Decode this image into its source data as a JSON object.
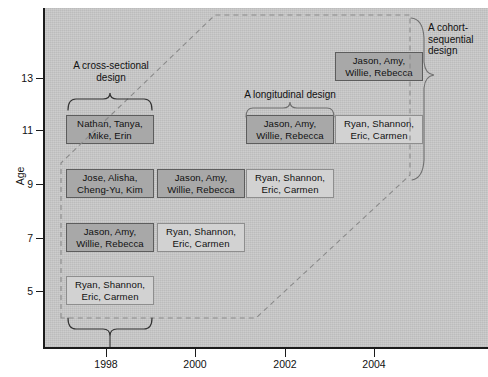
{
  "chart_data": {
    "type": "diagram",
    "title": "",
    "xlabel": "",
    "ylabel": "Age",
    "x_ticks": [
      "1998",
      "2000",
      "2002",
      "2004"
    ],
    "y_ticks": [
      "5",
      "7",
      "9",
      "11",
      "13"
    ],
    "xlim": [
      1996.6,
      2006.0
    ],
    "ylim": [
      3.6,
      14.6
    ],
    "grid": false,
    "legend": "none",
    "background_color": "#c9c9c9",
    "shaded_box_color": "#a8a8a8",
    "light_box_color": "#d2d2d2",
    "cohorts": [
      {
        "id": "cohort-1",
        "names_line1": "Ryan, Shannon,",
        "names_line2": "Eric, Carmen"
      },
      {
        "id": "cohort-2",
        "names_line1": "Jason, Amy,",
        "names_line2": "Willie, Rebecca"
      },
      {
        "id": "cohort-3",
        "names_line1": "Jose, Alisha,",
        "names_line2": "Cheng-Yu, Kim"
      },
      {
        "id": "cohort-4",
        "names_line1": "Nathan, Tanya,",
        "names_line2": "Mike, Erin"
      }
    ],
    "cells": [
      {
        "year": "1998",
        "age": "5",
        "line1": "Ryan, Shannon,",
        "line2": "Eric, Carmen",
        "shaded": false
      },
      {
        "year": "1998",
        "age": "7",
        "line1": "Jason, Amy,",
        "line2": "Willie, Rebecca",
        "shaded": true
      },
      {
        "year": "1998",
        "age": "9",
        "line1": "Jose, Alisha,",
        "line2": "Cheng-Yu, Kim",
        "shaded": true
      },
      {
        "year": "1998",
        "age": "11",
        "line1": "Nathan, Tanya,",
        "line2": "Mike, Erin",
        "shaded": true
      },
      {
        "year": "2000",
        "age": "7",
        "line1": "Ryan, Shannon,",
        "line2": "Eric, Carmen",
        "shaded": false
      },
      {
        "year": "2000",
        "age": "9",
        "line1": "Jason, Amy,",
        "line2": "Willie, Rebecca",
        "shaded": true
      },
      {
        "year": "2002",
        "age": "9",
        "line1": "Ryan, Shannon,",
        "line2": "Eric, Carmen",
        "shaded": false
      },
      {
        "year": "2002",
        "age": "11",
        "line1": "Jason, Amy,",
        "line2": "Willie, Rebecca",
        "shaded": true
      },
      {
        "year": "2004",
        "age": "11",
        "line1": "Ryan, Shannon,",
        "line2": "Eric, Carmen",
        "shaded": false
      },
      {
        "year": "2004",
        "age": "13",
        "line1": "Jason, Amy,",
        "line2": "Willie, Rebecca",
        "shaded": true
      }
    ],
    "annotations": [
      {
        "id": "cross-sectional",
        "line1": "A cross-sectional",
        "line2": "design",
        "brace": "horizontal-up"
      },
      {
        "id": "longitudinal",
        "line1": "A longitudinal design",
        "line2": "",
        "brace": "horizontal-down"
      },
      {
        "id": "cohort-sequential",
        "line1": "A cohort-",
        "line2": "sequential",
        "line3": "design",
        "brace": "vertical-right"
      },
      {
        "id": "cohort-brace-bottom",
        "line1": "",
        "line2": "",
        "brace": "horizontal-down"
      }
    ]
  },
  "axis": {
    "y_title": "Age",
    "y_ticks": [
      {
        "label": "13",
        "top": 78
      },
      {
        "label": "11",
        "top": 130
      },
      {
        "label": "9",
        "top": 184
      },
      {
        "label": "7",
        "top": 238
      },
      {
        "label": "5",
        "top": 291
      }
    ],
    "x_ticks": [
      {
        "label": "1998",
        "left": 106
      },
      {
        "label": "2000",
        "left": 195
      },
      {
        "label": "2002",
        "left": 285
      },
      {
        "label": "2004",
        "left": 374
      }
    ]
  },
  "boxes": [
    {
      "name": "box-1998-age11",
      "line1": "Nathan, Tanya,",
      "line2": "Mike, Erin",
      "shaded": true,
      "left": 66,
      "top": 115,
      "width": 88,
      "height": 29
    },
    {
      "name": "box-1998-age9",
      "line1": "Jose, Alisha,",
      "line2": "Cheng-Yu, Kim",
      "shaded": true,
      "left": 66,
      "top": 169,
      "width": 88,
      "height": 29
    },
    {
      "name": "box-1998-age7",
      "line1": "Jason, Amy,",
      "line2": "Willie, Rebecca",
      "shaded": true,
      "left": 66,
      "top": 223,
      "width": 88,
      "height": 29
    },
    {
      "name": "box-1998-age5",
      "line1": "Ryan, Shannon,",
      "line2": "Eric, Carmen",
      "shaded": false,
      "left": 66,
      "top": 276,
      "width": 88,
      "height": 29
    },
    {
      "name": "box-2000-age9",
      "line1": "Jason, Amy,",
      "line2": "Willie, Rebecca",
      "shaded": true,
      "left": 157,
      "top": 169,
      "width": 88,
      "height": 29
    },
    {
      "name": "box-2000-age7",
      "line1": "Ryan, Shannon,",
      "line2": "Eric, Carmen",
      "shaded": false,
      "left": 157,
      "top": 223,
      "width": 88,
      "height": 29
    },
    {
      "name": "box-2002-age11",
      "line1": "Jason, Amy,",
      "line2": "Willie, Rebecca",
      "shaded": true,
      "left": 246,
      "top": 115,
      "width": 88,
      "height": 29
    },
    {
      "name": "box-2002-age9",
      "line1": "Ryan, Shannon,",
      "line2": "Eric, Carmen",
      "shaded": false,
      "left": 246,
      "top": 169,
      "width": 88,
      "height": 29
    },
    {
      "name": "box-2004-age13",
      "line1": "Jason, Amy,",
      "line2": "Willie, Rebecca",
      "shaded": true,
      "left": 335,
      "top": 52,
      "width": 88,
      "height": 29
    },
    {
      "name": "box-2004-age11",
      "line1": "Ryan, Shannon,",
      "line2": "Eric, Carmen",
      "shaded": false,
      "left": 335,
      "top": 115,
      "width": 88,
      "height": 29
    }
  ],
  "annotations": {
    "cross_sectional": {
      "line1": "A cross-sectional",
      "line2": "design"
    },
    "longitudinal": {
      "line1": "A longitudinal design"
    },
    "cohort_sequential": {
      "line1": "A cohort-",
      "line2": "sequential",
      "line3": "design"
    }
  }
}
